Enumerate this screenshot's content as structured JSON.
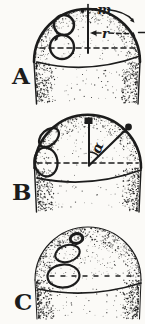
{
  "figure": {
    "ink_color": "#1c1c1c",
    "paper_color": "#fbfaf7",
    "panels": [
      {
        "label": "A",
        "annotations": {
          "m": "m",
          "r": "r"
        }
      },
      {
        "label": "B",
        "annotations": {
          "alpha": "α"
        }
      },
      {
        "label": "C",
        "annotations": {}
      }
    ]
  }
}
